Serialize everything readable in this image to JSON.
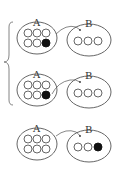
{
  "diagram": {
    "type": "set-transfer-illustration",
    "colors": {
      "stroke": "#555555",
      "filled": "#111111",
      "background": "#ffffff"
    },
    "brace": {
      "spans_rows": [
        1,
        2
      ]
    },
    "rows": [
      {
        "set_a": {
          "label": "A",
          "circles": [
            "empty",
            "empty",
            "empty",
            "empty",
            "empty",
            "filled"
          ]
        },
        "set_b": {
          "label": "B",
          "circles": [
            "empty",
            "empty",
            "empty"
          ]
        },
        "arrow": "A-to-B"
      },
      {
        "set_a": {
          "label": "A",
          "circles": [
            "empty",
            "empty",
            "empty",
            "empty",
            "empty",
            "filled"
          ]
        },
        "set_b": {
          "label": "B",
          "circles": [
            "empty",
            "empty",
            "empty"
          ]
        },
        "arrow": "A-to-B"
      },
      {
        "set_a": {
          "label": "A",
          "circles": [
            "empty",
            "empty",
            "empty",
            "empty",
            "empty",
            "empty"
          ]
        },
        "set_b": {
          "label": "B",
          "circles": [
            "empty",
            "empty",
            "filled"
          ]
        },
        "arrow": "A-to-B"
      }
    ]
  }
}
